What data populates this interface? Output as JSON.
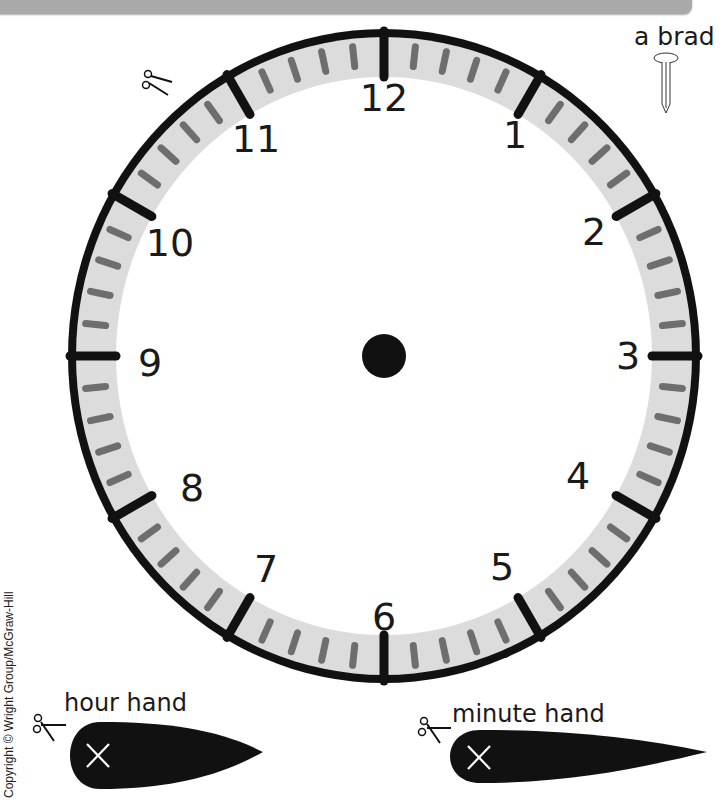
{
  "clock": {
    "numbers": [
      "12",
      "1",
      "2",
      "3",
      "4",
      "5",
      "6",
      "7",
      "8",
      "9",
      "10",
      "11"
    ],
    "center_dot_color": "#111111",
    "rim_color": "#111111",
    "band_color": "#dcdcdc",
    "minute_tick_color": "#6e6e6e",
    "hour_tick_color": "#111111"
  },
  "labels": {
    "brad": "a brad",
    "hour_hand": "hour hand",
    "minute_hand": "minute hand",
    "copyright": "Copyright © Wright Group/McGraw-Hill"
  },
  "icons": {
    "scissors": "scissors-icon",
    "brad": "brad-icon",
    "cross_mark": "x-mark-icon"
  }
}
